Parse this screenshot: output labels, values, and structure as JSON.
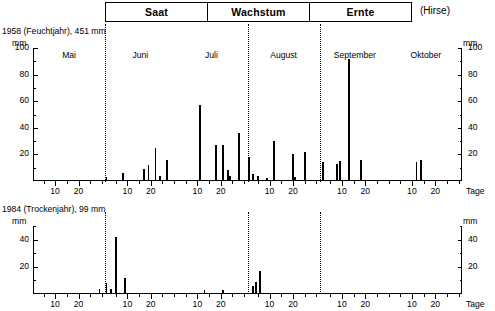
{
  "header": {
    "phases": [
      "Saat",
      "Wachstum",
      "Ernte"
    ],
    "crop_note": "(Hirse)"
  },
  "charts": [
    {
      "id": "chart-1958",
      "title": "1958 (Feuchtjahr), 451 mm",
      "unit_left": "mm",
      "unit_right": "mm",
      "tage_label": "Tage"
    },
    {
      "id": "chart-1984",
      "title": "1984 (Trockenjahr), 99 mm",
      "unit_left": "mm",
      "unit_right": "mm",
      "tage_label": "Tage"
    }
  ],
  "chart_data": [
    {
      "type": "bar",
      "id": "1958",
      "title": "1958 (Feuchtjahr), 451 mm",
      "subtitle": "Hirse — Saat / Wachstum / Ernte",
      "xlabel": "Tage",
      "ylabel": "mm",
      "ylim": [
        0,
        100
      ],
      "yticks": [
        20,
        40,
        60,
        80,
        100
      ],
      "grid": false,
      "legend": "none",
      "months": [
        "Mai",
        "Juni",
        "Juli",
        "August",
        "September",
        "Oktober"
      ],
      "month_days": [
        31,
        30,
        31,
        31,
        30,
        31
      ],
      "xticks_per_month": [
        10,
        20
      ],
      "annual_total_mm": 451,
      "phase_boundaries_day": [
        31,
        92,
        123
      ],
      "series": [
        {
          "name": "Tagesniederschlag 1958",
          "points": [
            {
              "month": "Juni",
              "day": 1,
              "value": 3
            },
            {
              "month": "Juni",
              "day": 8,
              "value": 6
            },
            {
              "month": "Juni",
              "day": 17,
              "value": 9
            },
            {
              "month": "Juni",
              "day": 19,
              "value": 12
            },
            {
              "month": "Juni",
              "day": 22,
              "value": 25
            },
            {
              "month": "Juni",
              "day": 24,
              "value": 4
            },
            {
              "month": "Juni",
              "day": 27,
              "value": 16
            },
            {
              "month": "Juli",
              "day": 11,
              "value": 57
            },
            {
              "month": "Juli",
              "day": 18,
              "value": 27
            },
            {
              "month": "Juli",
              "day": 21,
              "value": 27
            },
            {
              "month": "Juli",
              "day": 23,
              "value": 8
            },
            {
              "month": "Juli",
              "day": 24,
              "value": 4
            },
            {
              "month": "Juli",
              "day": 28,
              "value": 36
            },
            {
              "month": "August",
              "day": 1,
              "value": 18
            },
            {
              "month": "August",
              "day": 3,
              "value": 5
            },
            {
              "month": "August",
              "day": 5,
              "value": 4
            },
            {
              "month": "August",
              "day": 9,
              "value": 2
            },
            {
              "month": "August",
              "day": 12,
              "value": 30
            },
            {
              "month": "August",
              "day": 20,
              "value": 20
            },
            {
              "month": "August",
              "day": 21,
              "value": 3
            },
            {
              "month": "August",
              "day": 25,
              "value": 22
            },
            {
              "month": "September",
              "day": 2,
              "value": 14
            },
            {
              "month": "September",
              "day": 8,
              "value": 13
            },
            {
              "month": "September",
              "day": 9,
              "value": 15
            },
            {
              "month": "September",
              "day": 13,
              "value": 92
            },
            {
              "month": "September",
              "day": 18,
              "value": 16
            },
            {
              "month": "Oktober",
              "day": 12,
              "value": 14
            },
            {
              "month": "Oktober",
              "day": 14,
              "value": 16
            }
          ]
        }
      ]
    },
    {
      "type": "bar",
      "id": "1984",
      "title": "1984 (Trockenjahr), 99 mm",
      "subtitle": "Hirse — Saat / Wachstum / Ernte",
      "xlabel": "Tage",
      "ylabel": "mm",
      "ylim": [
        0,
        50
      ],
      "yticks": [
        20,
        40
      ],
      "grid": false,
      "legend": "none",
      "months": [
        "Mai",
        "Juni",
        "Juli",
        "August",
        "September",
        "Oktober"
      ],
      "month_days": [
        31,
        30,
        31,
        31,
        30,
        31
      ],
      "xticks_per_month": [
        10,
        20
      ],
      "annual_total_mm": 99,
      "phase_boundaries_day": [
        31,
        92,
        123
      ],
      "series": [
        {
          "name": "Tagesniederschlag 1984",
          "points": [
            {
              "month": "Mai",
              "day": 29,
              "value": 4
            },
            {
              "month": "Juni",
              "day": 1,
              "value": 8
            },
            {
              "month": "Juni",
              "day": 3,
              "value": 4
            },
            {
              "month": "Juni",
              "day": 5,
              "value": 42
            },
            {
              "month": "Juni",
              "day": 9,
              "value": 12
            },
            {
              "month": "Juli",
              "day": 13,
              "value": 3
            },
            {
              "month": "Juli",
              "day": 21,
              "value": 3
            },
            {
              "month": "August",
              "day": 3,
              "value": 6
            },
            {
              "month": "August",
              "day": 4,
              "value": 9
            },
            {
              "month": "August",
              "day": 6,
              "value": 17
            }
          ]
        }
      ]
    }
  ]
}
